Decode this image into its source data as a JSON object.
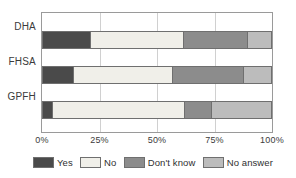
{
  "chart_data": {
    "type": "bar",
    "orientation": "horizontal",
    "stacked": true,
    "stack_mode": "percent",
    "title": "",
    "subtitle": "",
    "xlabel": "",
    "ylabel": "",
    "xlim": [
      0,
      100
    ],
    "xticks": [
      0,
      25,
      50,
      75,
      100
    ],
    "xtick_labels": [
      "0%",
      "25%",
      "50%",
      "75%",
      "100%"
    ],
    "grid": true,
    "grid_axis": "x",
    "legend_position": "bottom",
    "categories": [
      "DHA",
      "FHSA",
      "GPFH"
    ],
    "series": [
      {
        "name": "Yes",
        "color": "#4a4a4a",
        "values": [
          20.5,
          13.0,
          4.0
        ]
      },
      {
        "name": "No",
        "color": "#f0efe9",
        "values": [
          41.0,
          43.5,
          58.0
        ]
      },
      {
        "name": "Don't know",
        "color": "#8c8c8c",
        "values": [
          28.0,
          31.0,
          11.5
        ]
      },
      {
        "name": "No answer",
        "color": "#bcbcbc",
        "values": [
          10.5,
          12.5,
          26.5
        ]
      }
    ]
  },
  "axis": {
    "category_labels": [
      "DHA",
      "FHSA",
      "GPFH"
    ],
    "tick_labels": [
      "0%",
      "25%",
      "50%",
      "75%",
      "100%"
    ]
  },
  "legend": {
    "items": [
      {
        "label": "Yes"
      },
      {
        "label": "No"
      },
      {
        "label": "Don't know"
      },
      {
        "label": "No answer"
      }
    ]
  }
}
